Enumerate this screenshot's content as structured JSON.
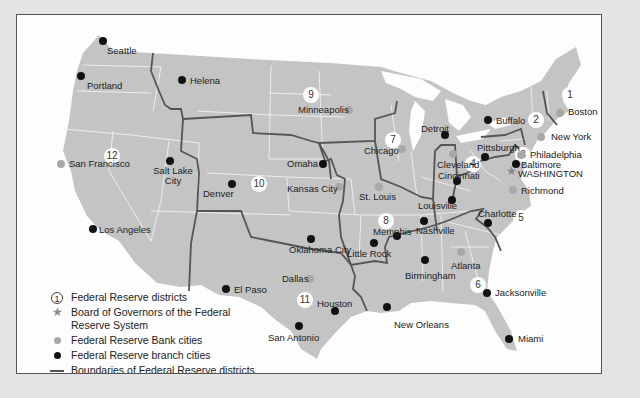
{
  "map": {
    "colors": {
      "land": "#c4c4c4",
      "state_border": "#f2f2f2",
      "district_border": "#555555",
      "bank_city": "#a8a8a8",
      "branch_city": "#111111",
      "background": "#fdfdfd",
      "frame": "#e4e4e4"
    },
    "districts": [
      {
        "num": "1",
        "x": 561,
        "y": 86
      },
      {
        "num": "2",
        "x": 527,
        "y": 111
      },
      {
        "num": "3",
        "x": 514,
        "y": 146
      },
      {
        "num": "4",
        "x": 464,
        "y": 155
      },
      {
        "num": "5",
        "x": 512,
        "y": 209
      },
      {
        "num": "6",
        "x": 469,
        "y": 276
      },
      {
        "num": "7",
        "x": 384,
        "y": 131
      },
      {
        "num": "8",
        "x": 377,
        "y": 212
      },
      {
        "num": "9",
        "x": 302,
        "y": 86
      },
      {
        "num": "10",
        "x": 250,
        "y": 175
      },
      {
        "num": "11",
        "x": 296,
        "y": 291
      },
      {
        "num": "12",
        "x": 103,
        "y": 147
      }
    ],
    "bank_cities": [
      {
        "name": "Boston",
        "x": 559,
        "y": 112,
        "lx": 567,
        "ly": 106
      },
      {
        "name": "New York",
        "x": 540,
        "y": 136,
        "lx": 550,
        "ly": 131
      },
      {
        "name": "Philadelphia",
        "x": 520,
        "y": 154,
        "lx": 529,
        "ly": 149
      },
      {
        "name": "Cleveland",
        "x": 452,
        "y": 153,
        "lx": 436,
        "ly": 159
      },
      {
        "name": "Richmond",
        "x": 512,
        "y": 189,
        "lx": 520,
        "ly": 185
      },
      {
        "name": "Atlanta",
        "x": 460,
        "y": 251,
        "lx": 450,
        "ly": 260
      },
      {
        "name": "Chicago",
        "x": 401,
        "y": 148,
        "lx": 363,
        "ly": 145
      },
      {
        "name": "St. Louis",
        "x": 378,
        "y": 186,
        "lx": 358,
        "ly": 191
      },
      {
        "name": "Minneapolis",
        "x": 348,
        "y": 109,
        "lx": 297,
        "ly": 104
      },
      {
        "name": "Kansas City",
        "x": 338,
        "y": 186,
        "lx": 286,
        "ly": 183
      },
      {
        "name": "Dallas",
        "x": 309,
        "y": 278,
        "lx": 281,
        "ly": 273
      },
      {
        "name": "San Francisco",
        "x": 60,
        "y": 163,
        "lx": 68,
        "ly": 158
      }
    ],
    "branch_cities": [
      {
        "name": "Buffalo",
        "x": 487,
        "y": 119,
        "lx": 495,
        "ly": 115
      },
      {
        "name": "Detroit",
        "x": 444,
        "y": 134,
        "lx": 420,
        "ly": 123
      },
      {
        "name": "Pittsburgh",
        "x": 484,
        "y": 154,
        "lx": 476,
        "ly": 142
      },
      {
        "name": "Baltimore",
        "x": 515,
        "y": 163,
        "lx": 520,
        "ly": 159
      },
      {
        "name": "Cincinnati",
        "x": 456,
        "y": 180,
        "lx": 437,
        "ly": 170
      },
      {
        "name": "Louisville",
        "x": 451,
        "y": 198,
        "lx": 417,
        "ly": 200
      },
      {
        "name": "Charlotte",
        "x": 487,
        "y": 222,
        "lx": 477,
        "ly": 208
      },
      {
        "name": "Nashville",
        "x": 423,
        "y": 220,
        "lx": 415,
        "ly": 225
      },
      {
        "name": "Memphis",
        "x": 396,
        "y": 235,
        "lx": 372,
        "ly": 226
      },
      {
        "name": "Little Rock",
        "x": 373,
        "y": 242,
        "lx": 346,
        "ly": 248
      },
      {
        "name": "Birmingham",
        "x": 424,
        "y": 259,
        "lx": 404,
        "ly": 270
      },
      {
        "name": "Jacksonville",
        "x": 486,
        "y": 292,
        "lx": 494,
        "ly": 287
      },
      {
        "name": "Miami",
        "x": 508,
        "y": 338,
        "lx": 517,
        "ly": 333
      },
      {
        "name": "New Orleans",
        "x": 386,
        "y": 306,
        "lx": 393,
        "ly": 319
      },
      {
        "name": "Houston",
        "x": 334,
        "y": 310,
        "lx": 316,
        "ly": 298
      },
      {
        "name": "San Antonio",
        "x": 298,
        "y": 325,
        "lx": 267,
        "ly": 332
      },
      {
        "name": "El Paso",
        "x": 225,
        "y": 288,
        "lx": 233,
        "ly": 284
      },
      {
        "name": "Oklahoma City",
        "x": 310,
        "y": 238,
        "lx": 288,
        "ly": 244
      },
      {
        "name": "Omaha",
        "x": 322,
        "y": 163,
        "lx": 286,
        "ly": 158
      },
      {
        "name": "Denver",
        "x": 231,
        "y": 183,
        "lx": 202,
        "ly": 188
      },
      {
        "name": "Salt Lake City",
        "x": 169,
        "y": 160,
        "lx": 152,
        "ly": 165
      },
      {
        "name": "Los Angeles",
        "x": 92,
        "y": 228,
        "lx": 98,
        "ly": 224
      },
      {
        "name": "Helena",
        "x": 181,
        "y": 79,
        "lx": 189,
        "ly": 75
      },
      {
        "name": "Portland",
        "x": 80,
        "y": 75,
        "lx": 86,
        "ly": 80
      },
      {
        "name": "Seattle",
        "x": 102,
        "y": 40,
        "lx": 106,
        "ly": 45
      }
    ],
    "board_of_governors": {
      "name": "WASHINGTON",
      "x": 511,
      "y": 171,
      "lx": 517,
      "ly": 168
    }
  },
  "legend": {
    "items": [
      {
        "icon": "circled-number",
        "symbol": "1",
        "label": "Federal Reserve districts"
      },
      {
        "icon": "star",
        "label": "Board of Governors of the Federal Reserve System"
      },
      {
        "icon": "gray-dot",
        "label": "Federal Reserve Bank cities"
      },
      {
        "icon": "black-dot",
        "label": "Federal Reserve branch cities"
      },
      {
        "icon": "line",
        "label": "Boundaries of Federal Reserve districts (Alaska and Hawaii are in District 12)"
      }
    ]
  }
}
